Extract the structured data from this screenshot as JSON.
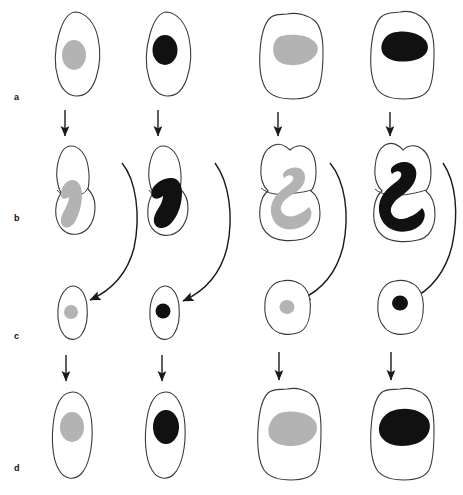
{
  "figure": {
    "background_color": "#ffffff",
    "width": 463,
    "height": 495,
    "outline_color": "#3a3a3a",
    "arrow_color": "#1a1a1a",
    "nucleus_light_color": "#b3b3b3",
    "nucleus_dark_color": "#111111"
  },
  "row_labels": [
    {
      "id": "a",
      "text": "a"
    },
    {
      "id": "b",
      "text": "b"
    },
    {
      "id": "c",
      "text": "c"
    },
    {
      "id": "d",
      "text": "d"
    }
  ],
  "columns": [
    {
      "id": "col-1",
      "nucleus_shade": "light",
      "cell_form": "elongated-oval"
    },
    {
      "id": "col-2",
      "nucleus_shade": "dark",
      "cell_form": "elongated-oval"
    },
    {
      "id": "col-3",
      "nucleus_shade": "light",
      "cell_form": "rounded-broad"
    },
    {
      "id": "col-4",
      "nucleus_shade": "dark",
      "cell_form": "rounded-broad"
    }
  ],
  "stages": [
    {
      "id": "a",
      "label": "a",
      "description": "Interphase cell with single rounded nucleus",
      "cells": [
        {
          "column": 1,
          "nucleus": "round-oval-nucleus",
          "shade": "light"
        },
        {
          "column": 2,
          "nucleus": "round-oval-nucleus",
          "shade": "dark"
        },
        {
          "column": 3,
          "nucleus": "broad-oval-nucleus",
          "shade": "light"
        },
        {
          "column": 4,
          "nucleus": "kidney-shaped-nucleus",
          "shade": "dark"
        }
      ]
    },
    {
      "id": "b",
      "label": "b",
      "description": "Constricting cell with hooked / J-shaped nucleus spanning the cleavage furrow",
      "cells": [
        {
          "column": 1,
          "nucleus": "hooked-nucleus",
          "shade": "light"
        },
        {
          "column": 2,
          "nucleus": "hooked-nucleus",
          "shade": "dark"
        },
        {
          "column": 3,
          "nucleus": "s-curved-nucleus",
          "shade": "light"
        },
        {
          "column": 4,
          "nucleus": "s-curved-nucleus",
          "shade": "dark"
        }
      ]
    },
    {
      "id": "c",
      "label": "c",
      "description": "Small daughter cell with compact nucleus",
      "cells": [
        {
          "column": 1,
          "nucleus": "small-round-nucleus",
          "shade": "light"
        },
        {
          "column": 2,
          "nucleus": "small-round-nucleus",
          "shade": "dark"
        },
        {
          "column": 3,
          "nucleus": "small-round-nucleus",
          "shade": "light"
        },
        {
          "column": 4,
          "nucleus": "small-round-nucleus",
          "shade": "dark"
        }
      ]
    },
    {
      "id": "d",
      "label": "d",
      "description": "Grown daughter cell with enlarged nucleus",
      "cells": [
        {
          "column": 1,
          "nucleus": "oval-nucleus",
          "shade": "light"
        },
        {
          "column": 2,
          "nucleus": "oval-nucleus",
          "shade": "dark"
        },
        {
          "column": 3,
          "nucleus": "broad-oval-nucleus",
          "shade": "light"
        },
        {
          "column": 4,
          "nucleus": "kidney-shaped-nucleus",
          "shade": "dark"
        }
      ]
    }
  ],
  "arrows": {
    "straight_a_to_b": {
      "count": 4,
      "direction": "down",
      "name": "arrow-a-to-b"
    },
    "curved_b_to_c": {
      "count": 4,
      "direction": "curved-down-left",
      "name": "arrow-b-to-c"
    },
    "straight_c_to_d": {
      "count": 4,
      "direction": "down",
      "name": "arrow-c-to-d"
    }
  }
}
